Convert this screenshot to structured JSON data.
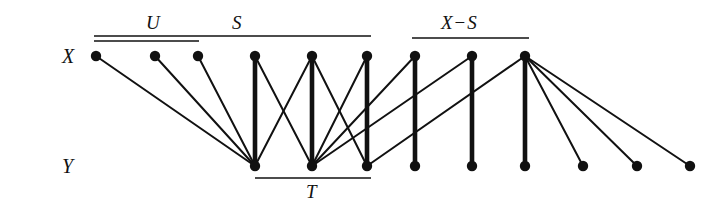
{
  "figure": {
    "type": "bipartite-graph-diagram",
    "width": 724,
    "height": 208,
    "background_color": "#ffffff",
    "ink_color": "#111111"
  },
  "row_labels": {
    "top": "X",
    "bottom": "Y"
  },
  "set_labels": {
    "u": "U",
    "s": "S",
    "x_minus_s": "X − S",
    "x_minus_s_left": "X",
    "x_minus_s_op": "−",
    "x_minus_s_right": "S",
    "t": "T"
  },
  "brackets": [
    {
      "name": "U",
      "label": "U",
      "side": "top",
      "x1": 94,
      "x2": 199,
      "y": 41,
      "label_x": 146,
      "label_y": 13
    },
    {
      "name": "S",
      "label": "S",
      "side": "top",
      "x1": 94,
      "x2": 371,
      "y": 36,
      "label_x": 232,
      "label_y": 13
    },
    {
      "name": "X-S",
      "label": "X − S",
      "side": "top",
      "x1": 412,
      "x2": 529,
      "y": 38,
      "label_x": 441,
      "label_y": 13
    },
    {
      "name": "T",
      "label": "T",
      "side": "bottom",
      "x1": 255,
      "x2": 371,
      "y": 178,
      "label_x": 306,
      "label_y": 182
    }
  ],
  "nodes": {
    "radius": 5.2,
    "x_row_y": 56,
    "y_row_y": 166,
    "x_nodes": [
      {
        "id": "x1",
        "x": 96,
        "in_sets": [
          "U",
          "S"
        ]
      },
      {
        "id": "x2",
        "x": 155,
        "in_sets": [
          "U",
          "S"
        ]
      },
      {
        "id": "x3",
        "x": 198,
        "in_sets": [
          "U",
          "S"
        ]
      },
      {
        "id": "x4",
        "x": 255,
        "in_sets": [
          "S"
        ]
      },
      {
        "id": "x5",
        "x": 312,
        "in_sets": [
          "S"
        ]
      },
      {
        "id": "x6",
        "x": 367,
        "in_sets": [
          "S"
        ]
      },
      {
        "id": "x7",
        "x": 415,
        "in_sets": [
          "X-S"
        ]
      },
      {
        "id": "x8",
        "x": 472,
        "in_sets": [
          "X-S"
        ]
      },
      {
        "id": "x9",
        "x": 525,
        "in_sets": [
          "X-S"
        ]
      }
    ],
    "y_nodes": [
      {
        "id": "y1",
        "x": 255,
        "in_sets": [
          "T"
        ]
      },
      {
        "id": "y2",
        "x": 312,
        "in_sets": [
          "T"
        ]
      },
      {
        "id": "y3",
        "x": 367,
        "in_sets": [
          "T"
        ]
      },
      {
        "id": "y4",
        "x": 415,
        "in_sets": []
      },
      {
        "id": "y5",
        "x": 472,
        "in_sets": []
      },
      {
        "id": "y6",
        "x": 525,
        "in_sets": []
      },
      {
        "id": "y7",
        "x": 583,
        "in_sets": []
      },
      {
        "id": "y8",
        "x": 637,
        "in_sets": []
      },
      {
        "id": "y9",
        "x": 690,
        "in_sets": []
      }
    ]
  },
  "edges": [
    {
      "from": "x1",
      "to": "y1",
      "weight": "thin"
    },
    {
      "from": "x2",
      "to": "y1",
      "weight": "thin"
    },
    {
      "from": "x3",
      "to": "y1",
      "weight": "thin"
    },
    {
      "from": "x4",
      "to": "y1",
      "weight": "thick"
    },
    {
      "from": "x4",
      "to": "y2",
      "weight": "thin"
    },
    {
      "from": "x5",
      "to": "y1",
      "weight": "thin"
    },
    {
      "from": "x5",
      "to": "y2",
      "weight": "thick"
    },
    {
      "from": "x5",
      "to": "y3",
      "weight": "thin"
    },
    {
      "from": "x6",
      "to": "y2",
      "weight": "thin"
    },
    {
      "from": "x6",
      "to": "y3",
      "weight": "thick"
    },
    {
      "from": "x7",
      "to": "y2",
      "weight": "thin"
    },
    {
      "from": "x7",
      "to": "y4",
      "weight": "thick"
    },
    {
      "from": "x8",
      "to": "y2",
      "weight": "thin"
    },
    {
      "from": "x8",
      "to": "y5",
      "weight": "thick"
    },
    {
      "from": "x9",
      "to": "y3",
      "weight": "thin"
    },
    {
      "from": "x9",
      "to": "y6",
      "weight": "thick"
    },
    {
      "from": "x9",
      "to": "y7",
      "weight": "thin"
    },
    {
      "from": "x9",
      "to": "y8",
      "weight": "thin"
    },
    {
      "from": "x9",
      "to": "y9",
      "weight": "thin"
    }
  ],
  "stroke_widths": {
    "thin": 2.0,
    "thick": 4.6,
    "bracket": 1.6
  },
  "label_positions": {
    "row_x": {
      "x": 62,
      "y": 46
    },
    "row_y": {
      "x": 62,
      "y": 156
    }
  }
}
